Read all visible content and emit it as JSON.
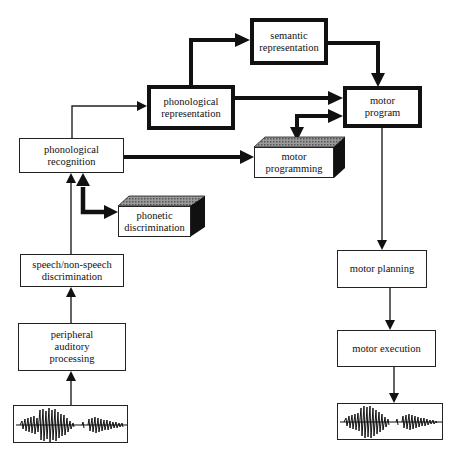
{
  "diagram": {
    "type": "flowchart",
    "nodes": {
      "semantic": {
        "label": "semantic\nrepresentation",
        "style": "thick"
      },
      "phon_rep": {
        "label": "phonological\nrepresentation",
        "style": "thick"
      },
      "motor_program": {
        "label": "motor\nprogram",
        "style": "thick"
      },
      "phon_recog": {
        "label": "phonological\nrecognition",
        "style": "thin"
      },
      "motor_programming": {
        "label": "motor\nprogramming",
        "style": "3d-block"
      },
      "phonetic_disc": {
        "label": "phonetic\ndiscrimination",
        "style": "3d-block"
      },
      "speech_disc": {
        "label": "speech/non-speech\ndiscrimination",
        "style": "thin"
      },
      "peripheral": {
        "label": "peripheral\nauditory\nprocessing",
        "style": "thin"
      },
      "motor_planning": {
        "label": "motor planning",
        "style": "thin"
      },
      "motor_execution": {
        "label": "motor execution",
        "style": "thin"
      },
      "input_wave": {
        "label": "speech waveform (input)",
        "style": "waveform"
      },
      "output_wave": {
        "label": "speech waveform (output)",
        "style": "waveform"
      }
    },
    "edges": [
      {
        "from": "input_wave",
        "to": "peripheral",
        "weight": "thin"
      },
      {
        "from": "peripheral",
        "to": "speech_disc",
        "weight": "thin"
      },
      {
        "from": "speech_disc",
        "to": "phon_recog",
        "weight": "thin"
      },
      {
        "from": "phon_recog",
        "to": "phonetic_disc",
        "weight": "thick",
        "bidirectional": true
      },
      {
        "from": "phon_recog",
        "to": "phon_rep",
        "weight": "thin"
      },
      {
        "from": "phon_recog",
        "to": "motor_programming",
        "weight": "thick"
      },
      {
        "from": "phon_rep",
        "to": "semantic",
        "weight": "thick"
      },
      {
        "from": "phon_rep",
        "to": "motor_program",
        "weight": "thick"
      },
      {
        "from": "semantic",
        "to": "motor_program",
        "weight": "thick"
      },
      {
        "from": "motor_program",
        "to": "motor_programming",
        "weight": "thick",
        "bidirectional": true
      },
      {
        "from": "motor_program",
        "to": "motor_planning",
        "weight": "thin"
      },
      {
        "from": "motor_planning",
        "to": "motor_execution",
        "weight": "thin"
      },
      {
        "from": "motor_execution",
        "to": "output_wave",
        "weight": "thin"
      }
    ]
  }
}
